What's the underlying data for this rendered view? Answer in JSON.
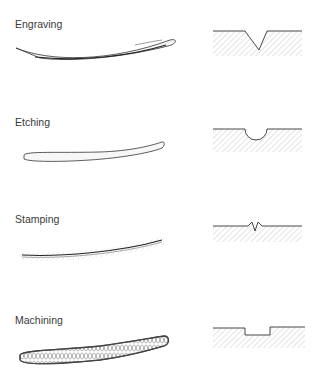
{
  "diagram": {
    "type": "technical-illustration",
    "colors": {
      "line": "#333333",
      "hatch": "#9a9a9a",
      "background": "#ffffff"
    },
    "methods": [
      {
        "label": "Engraving",
        "stroke_style": "tapered-curved-cut",
        "profile": "v-groove"
      },
      {
        "label": "Etching",
        "stroke_style": "rounded-outline",
        "profile": "semicircular-groove"
      },
      {
        "label": "Stamping",
        "stroke_style": "line-with-stippled-edges",
        "profile": "narrow-notch-with-raised-lips"
      },
      {
        "label": "Machining",
        "stroke_style": "textured-milled-band",
        "profile": "flat-rectangular-groove"
      }
    ]
  }
}
